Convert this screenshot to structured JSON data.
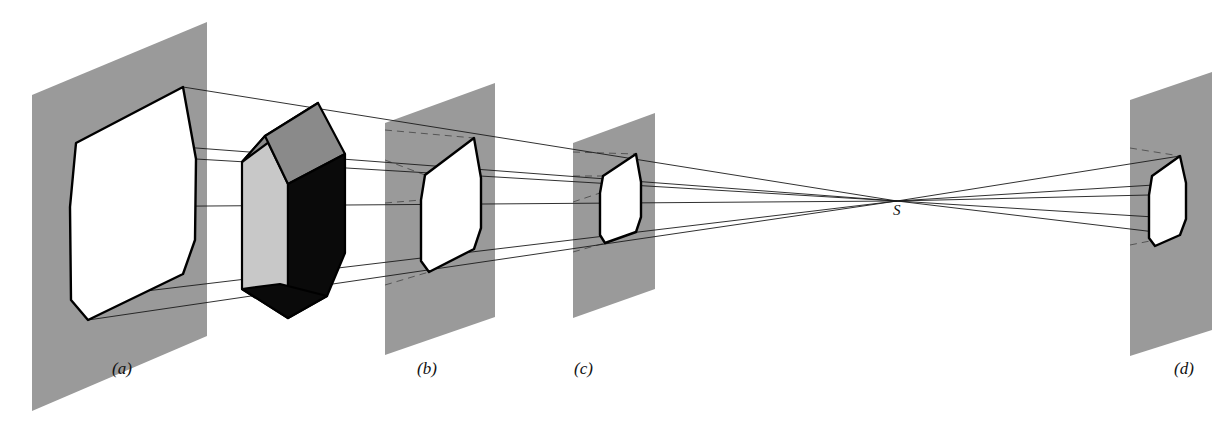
{
  "figure": {
    "background_color": "#ffffff",
    "width": 1220,
    "height": 425
  },
  "colors": {
    "plane_gray": "#9a9a9a",
    "solid_front_light_gray": "#c8c8c8",
    "solid_roof_mid_gray": "#8a8a8a",
    "solid_side_black": "#0a0a0a",
    "projection_white": "#ffffff",
    "line_black": "#000000",
    "ray_gray": "#333333"
  },
  "captions": [
    {
      "id": "caption-a",
      "text": "(a)",
      "x": 112,
      "y": 374
    },
    {
      "id": "caption-b",
      "text": "(b)",
      "x": 417,
      "y": 374
    },
    {
      "id": "caption-c",
      "text": "(c)",
      "x": 574,
      "y": 374
    },
    {
      "id": "caption-d",
      "text": "(d)",
      "x": 1174,
      "y": 374
    }
  ],
  "center_of_projection": {
    "label": "S",
    "x": 897,
    "y": 201,
    "label_x": 893,
    "label_y": 215
  },
  "planes": [
    {
      "id": "plane-a",
      "name": "picture-plane-a",
      "points": "32,95 207,22 207,336 32,411",
      "fill": "#9a9a9a"
    },
    {
      "id": "plane-b",
      "name": "picture-plane-b",
      "points": "385,123 495,83 495,317 385,355",
      "fill": "#9a9a9a"
    },
    {
      "id": "plane-c",
      "name": "picture-plane-c",
      "points": "573,143 655,113 655,289 573,318",
      "fill": "#9a9a9a"
    },
    {
      "id": "plane-d",
      "name": "picture-plane-d",
      "points": "1130,100 1212,72 1212,330 1130,356",
      "fill": "#9a9a9a"
    }
  ],
  "projections": [
    {
      "id": "projection-a",
      "name": "projected-outline-a",
      "outline": "183,87 196,159 195,240 183,274 88,320 71,300 70,207 76,143",
      "inner_edges": [
        "76,143 88,222 183,274",
        "88,222 71,300",
        "88,222 195,240",
        "183,87 76,143"
      ]
    },
    {
      "id": "projection-b",
      "name": "projected-outline-b",
      "outline": "474,138 481,178 481,228 474,249 429,272 421,261 421,200 425,175",
      "inner_edges": [
        "425,175 429,216 474,249",
        "429,216 421,261",
        "429,216 481,228",
        "474,138 425,175"
      ]
    },
    {
      "id": "projection-c",
      "name": "projected-outline-c",
      "outline": "636,154 641,182 641,217 636,232 605,243 600,235 600,193 603,176",
      "inner_edges": [
        "603,176 605,205 636,232",
        "605,205 600,235",
        "605,205 641,217",
        "636,154 603,176"
      ]
    },
    {
      "id": "projection-d",
      "name": "projected-outline-d",
      "outline": "1180,156 1186,183 1186,219 1180,235 1155,246 1149,238 1149,195 1152,176",
      "inner_edges": [
        "1152,176 1155,207 1180,235",
        "1155,207 1149,238",
        "1155,207 1186,219",
        "1180,156 1152,176"
      ]
    }
  ],
  "solid": {
    "name": "house-shaped-prism",
    "faces": [
      {
        "id": "solid-front",
        "name": "solid-front-face",
        "points": "242,162 242,289 288,318 288,184 265,136",
        "fill": "#c8c8c8"
      },
      {
        "id": "solid-roof-left",
        "name": "solid-roof-left-face",
        "points": "242,162 265,136 318,103 292,125",
        "fill": "#8a8a8a"
      },
      {
        "id": "solid-roof-right",
        "name": "solid-roof-right-face",
        "points": "265,136 318,103 345,154 288,184",
        "fill": "#8a8a8a"
      },
      {
        "id": "solid-side",
        "name": "solid-right-side-face",
        "points": "288,184 345,154 345,253 327,296 288,318",
        "fill": "#0a0a0a"
      },
      {
        "id": "solid-bottom",
        "name": "solid-bottom-face",
        "points": "242,289 288,318 327,296 280,284",
        "fill": "#0a0a0a"
      }
    ],
    "edges": [
      "242,162 265,136 288,184 288,318 242,289 242,162",
      "265,136 318,103 345,154 288,184",
      "318,103 345,154",
      "345,154 345,253 327,296 288,318",
      "242,289 327,296",
      "242,162 292,125 318,103"
    ]
  },
  "projector_rays": [
    {
      "id": "ray-top",
      "name": "projector-ray-top",
      "d": "M 183,87 L 897,201"
    },
    {
      "id": "ray-upper-mid",
      "name": "projector-ray-upper-mid",
      "d": "M 196,159 L 897,201"
    },
    {
      "id": "ray-mid-high",
      "name": "projector-ray-mid-high",
      "d": "M 183,147 L 897,201"
    },
    {
      "id": "ray-center",
      "name": "projector-ray-center",
      "d": "M 70,207 L 897,201"
    },
    {
      "id": "ray-lower",
      "name": "projector-ray-lower",
      "d": "M 71,300 L 897,201"
    },
    {
      "id": "ray-bottom",
      "name": "projector-ray-bottom",
      "d": "M 88,320 L 897,201"
    },
    {
      "id": "ray-d-top",
      "name": "projector-ray-d-top",
      "d": "M 897,201 L 1180,156"
    },
    {
      "id": "ray-d-upper",
      "name": "projector-ray-d-upper",
      "d": "M 897,201 L 1186,183"
    },
    {
      "id": "ray-d-center",
      "name": "projector-ray-d-center",
      "d": "M 897,201 L 1149,195"
    },
    {
      "id": "ray-d-lower",
      "name": "projector-ray-d-lower",
      "d": "M 897,201 L 1186,219"
    },
    {
      "id": "ray-d-bottom",
      "name": "projector-ray-d-bottom",
      "d": "M 897,201 L 1180,235"
    }
  ],
  "hidden_rays": [
    {
      "id": "hidden-b-top",
      "name": "hidden-ray-b-top",
      "d": "M 385,130 L 474,138"
    },
    {
      "id": "hidden-b-upper",
      "name": "hidden-ray-b-upper",
      "d": "M 385,160 L 425,175"
    },
    {
      "id": "hidden-b-center",
      "name": "hidden-ray-b-center",
      "d": "M 385,203 L 421,200"
    },
    {
      "id": "hidden-b-bottom",
      "name": "hidden-ray-b-bottom",
      "d": "M 385,285 L 429,272"
    },
    {
      "id": "hidden-c-top",
      "name": "hidden-ray-c-top",
      "d": "M 573,152 L 636,154"
    },
    {
      "id": "hidden-c-upper",
      "name": "hidden-ray-c-upper",
      "d": "M 573,176 L 603,176"
    },
    {
      "id": "hidden-c-center",
      "name": "hidden-ray-c-center",
      "d": "M 573,202 L 600,193"
    },
    {
      "id": "hidden-c-bottom",
      "name": "hidden-ray-c-bottom",
      "d": "M 573,252 L 605,243"
    },
    {
      "id": "hidden-d-top",
      "name": "hidden-ray-d-top",
      "d": "M 1130,148 L 1180,156"
    },
    {
      "id": "hidden-d-bottom",
      "name": "hidden-ray-d-bottom",
      "d": "M 1130,245 L 1180,235"
    }
  ]
}
